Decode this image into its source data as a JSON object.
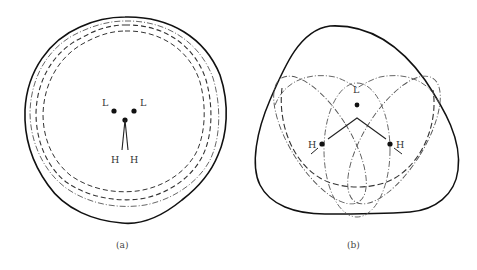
{
  "figure": {
    "panels": [
      {
        "id": "a",
        "caption": "(a)",
        "atom_labels": {
          "l_left": "L",
          "l_right": "L",
          "h_left": "H",
          "h_right": "H"
        }
      },
      {
        "id": "b",
        "caption": "(b)",
        "atom_labels": {
          "l_top": "L",
          "h_left": "H",
          "h_right": "H"
        }
      }
    ],
    "line_styles": {
      "solid": "outer contour",
      "dashed": "inner contour",
      "dash_dot": "intermediate contour"
    },
    "colors": {
      "stroke": "#111111",
      "dashed": "#333333",
      "dashdot": "#555555",
      "text": "#333333"
    }
  }
}
